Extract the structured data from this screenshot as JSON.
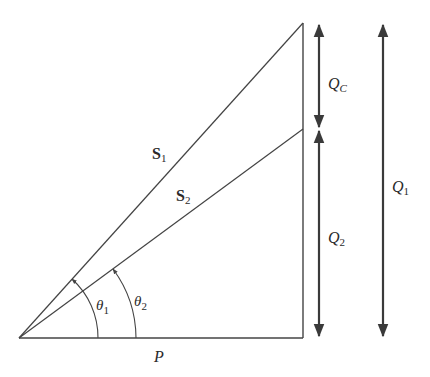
{
  "diagram": {
    "type": "power-triangle",
    "colors": {
      "line": "#444444",
      "arrow": "#3a3a3a",
      "text": "#2a2a2a",
      "background": "#ffffff"
    },
    "vectors": {
      "s1": {
        "label": "S",
        "subscript": "1"
      },
      "s2": {
        "label": "S",
        "subscript": "2"
      },
      "p": {
        "label": "P"
      }
    },
    "angles": {
      "theta1": {
        "label": "θ",
        "subscript": "1"
      },
      "theta2": {
        "label": "θ",
        "subscript": "2"
      }
    },
    "dimensions": {
      "qc": {
        "label": "Q",
        "subscript": "C"
      },
      "q2": {
        "label": "Q",
        "subscript": "2"
      },
      "q1": {
        "label": "Q",
        "subscript": "1"
      }
    }
  }
}
